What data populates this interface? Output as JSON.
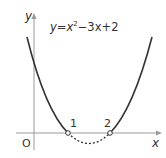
{
  "equation": {
    "y": "y",
    "eq": "=",
    "x": "x",
    "exp": "2",
    "rest": "−3x+2"
  },
  "axes": {
    "x_label": "x",
    "y_label": "y",
    "origin": "O"
  },
  "roots": [
    {
      "label": "1"
    },
    {
      "label": "2"
    }
  ],
  "colors": {
    "curve": "#333333",
    "axis": "#999999"
  }
}
